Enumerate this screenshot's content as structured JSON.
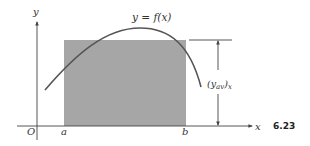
{
  "figure": {
    "number": "6.23",
    "curve_label": "y = f(x)",
    "y_axis_label": "y",
    "x_axis_label": "x",
    "origin_label": "O",
    "a_label": "a",
    "b_label": "b",
    "average_label": "(y",
    "average_sub": "av",
    "average_tail": ")",
    "average_subscript_x": "x"
  },
  "colors": {
    "rectangle_fill": "#a6a6a6",
    "axis": "#444444",
    "curve": "#555555",
    "background": "#ffffff"
  }
}
